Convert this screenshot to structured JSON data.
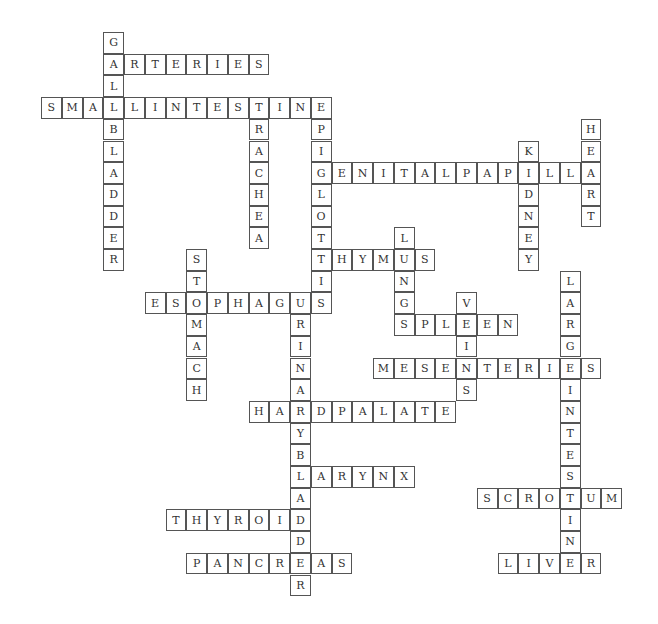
{
  "puzzle": {
    "type": "crossword",
    "grid": {
      "origin_x": 41,
      "origin_y": 32,
      "cell_w": 20.75,
      "cell_h": 21.7
    },
    "words": [
      {
        "word": "GALLBLADDER",
        "dir": "down",
        "row": 0,
        "col": 3
      },
      {
        "word": "ARTERIES",
        "dir": "across",
        "row": 1,
        "col": 3
      },
      {
        "word": "SMALLINTESTINE",
        "dir": "across",
        "row": 3,
        "col": 0
      },
      {
        "word": "TRACHEA",
        "dir": "down",
        "row": 3,
        "col": 10
      },
      {
        "word": "EPIGLOTTIS",
        "dir": "down",
        "row": 3,
        "col": 13
      },
      {
        "word": "GENITALPAPILLA",
        "dir": "across",
        "row": 6,
        "col": 13
      },
      {
        "word": "HEART",
        "dir": "down",
        "row": 4,
        "col": 26
      },
      {
        "word": "KIDNEY",
        "dir": "down",
        "row": 5,
        "col": 23
      },
      {
        "word": "THYMUS",
        "dir": "across",
        "row": 10,
        "col": 13
      },
      {
        "word": "LUNGS",
        "dir": "down",
        "row": 9,
        "col": 17
      },
      {
        "word": "STOMACH",
        "dir": "down",
        "row": 10,
        "col": 7
      },
      {
        "word": "ESOPHAGUS",
        "dir": "across",
        "row": 12,
        "col": 5
      },
      {
        "word": "URINARYBLADDER",
        "dir": "down",
        "row": 12,
        "col": 12
      },
      {
        "word": "VEINS",
        "dir": "down",
        "row": 12,
        "col": 20
      },
      {
        "word": "SPLEEN",
        "dir": "across",
        "row": 13,
        "col": 17
      },
      {
        "word": "LARGEINTESTINE",
        "dir": "down",
        "row": 11,
        "col": 25
      },
      {
        "word": "MESENTERIES",
        "dir": "across",
        "row": 15,
        "col": 16
      },
      {
        "word": "HARDPALATE",
        "dir": "across",
        "row": 17,
        "col": 10
      },
      {
        "word": "LARYNX",
        "dir": "across",
        "row": 20,
        "col": 12
      },
      {
        "word": "SCROTUM",
        "dir": "across",
        "row": 21,
        "col": 21
      },
      {
        "word": "THYROID",
        "dir": "across",
        "row": 22,
        "col": 6
      },
      {
        "word": "PANCREAS",
        "dir": "across",
        "row": 24,
        "col": 7
      },
      {
        "word": "LIVER",
        "dir": "across",
        "row": 24,
        "col": 22
      }
    ]
  }
}
